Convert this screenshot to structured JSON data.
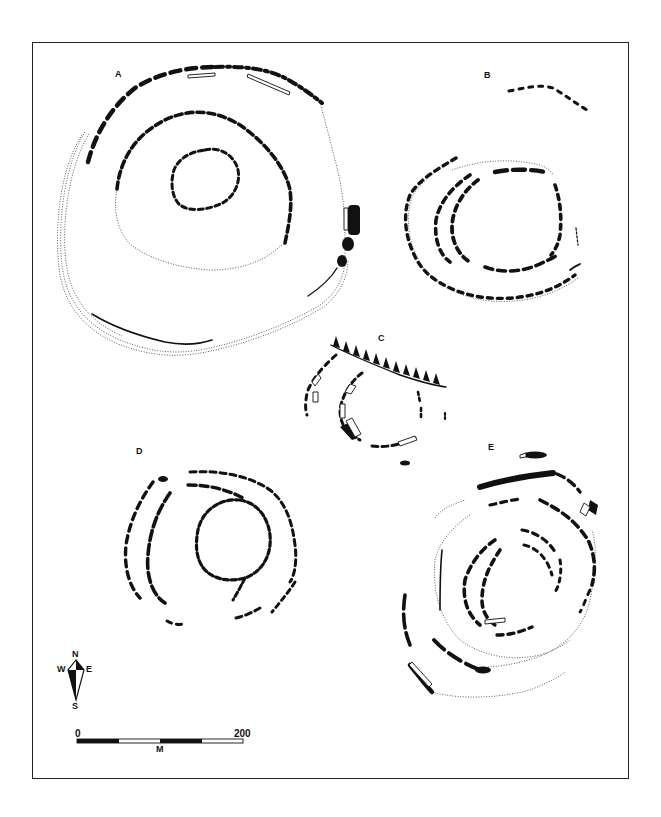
{
  "figure": {
    "type": "archaeological site plan",
    "background": "#ffffff",
    "ink": "#111111"
  },
  "sites": [
    {
      "id": "A",
      "label": "A"
    },
    {
      "id": "B",
      "label": "B"
    },
    {
      "id": "C",
      "label": "C"
    },
    {
      "id": "D",
      "label": "D"
    },
    {
      "id": "E",
      "label": "E"
    }
  ],
  "compass": {
    "north": "N",
    "south": "S",
    "east": "E",
    "west": "W"
  },
  "scale_bar": {
    "start": "0",
    "end": "200",
    "unit": "M"
  }
}
